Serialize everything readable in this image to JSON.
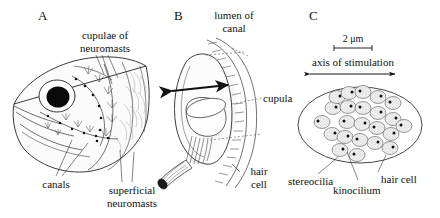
{
  "figure": {
    "background_color": "#ffffff",
    "ink_color": "#111111",
    "width": 440,
    "height": 218
  },
  "panels": [
    {
      "letter": "A",
      "name": "fish-head-lateral-line",
      "labels": [
        {
          "key": "cupulae",
          "text_lines": [
            "cupulae of",
            "neuromasts"
          ]
        },
        {
          "key": "canals",
          "text_lines": [
            "canals"
          ]
        },
        {
          "key": "superficial",
          "text_lines": [
            "superficial",
            "neuromasts"
          ]
        }
      ]
    },
    {
      "letter": "B",
      "name": "canal-neuromast-cupula",
      "labels": [
        {
          "key": "lumen",
          "text_lines": [
            "lumen of",
            "canal"
          ]
        },
        {
          "key": "cupula",
          "text_lines": [
            "cupula"
          ]
        },
        {
          "key": "hair_cell",
          "text_lines": [
            "hair",
            "cell"
          ]
        }
      ]
    },
    {
      "letter": "C",
      "name": "hair-cell-rosette",
      "scale_bar": {
        "value": "2",
        "unit": "μm",
        "label": "2 μm"
      },
      "axis_label": "axis of stimulation",
      "labels": [
        {
          "key": "stereocilia",
          "text_lines": [
            "stereocilia"
          ]
        },
        {
          "key": "kinocilium",
          "text_lines": [
            "kinocilium"
          ]
        },
        {
          "key": "hair_cell",
          "text_lines": [
            "hair cell"
          ]
        }
      ]
    }
  ],
  "panelA": {
    "letter": "A",
    "label_cupulae_line1": "cupulae of",
    "label_cupulae_line2": "neuromasts",
    "label_canals": "canals",
    "label_superficial_line1": "superficial",
    "label_superficial_line2": "neuromasts"
  },
  "panelB": {
    "letter": "B",
    "label_lumen_line1": "lumen of",
    "label_lumen_line2": "canal",
    "label_cupula": "cupula",
    "label_haircell_line1": "hair",
    "label_haircell_line2": "cell"
  },
  "panelC": {
    "letter": "C",
    "scale_label": "2 μm",
    "axis_label": "axis of stimulation",
    "label_stereocilia": "stereocilia",
    "label_kinocilium": "kinocilium",
    "label_haircell": "hair cell"
  }
}
